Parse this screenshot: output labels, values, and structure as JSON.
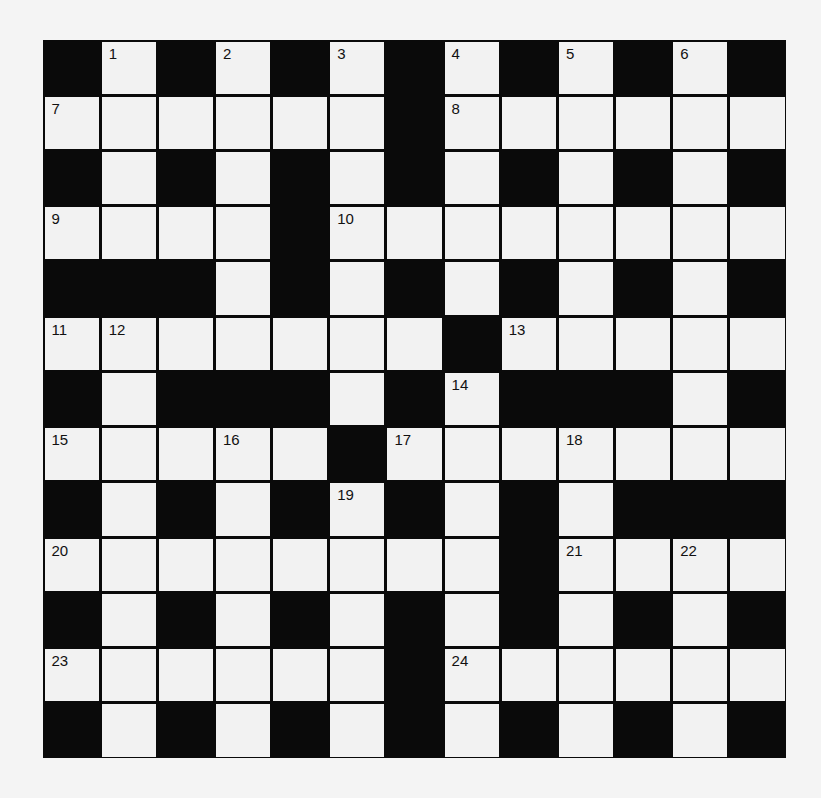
{
  "puzzle": {
    "type": "crossword",
    "rows": 13,
    "cols": 13,
    "grid": [
      "#.#.#.#.#.#.#",
      "......#......",
      "#.#.#.#.#.#.#",
      "....#........",
      "###.#.#.#.#.#",
      ".......#.....",
      "#.###.#.###.#",
      ".....#.......",
      "#.#.#.#.#.###",
      "........#....",
      "#.#.#.#.#.#.#",
      "......#......",
      "#.#.#.#.#.#.#"
    ],
    "numbers": [
      {
        "n": "1",
        "r": 0,
        "c": 1
      },
      {
        "n": "2",
        "r": 0,
        "c": 3
      },
      {
        "n": "3",
        "r": 0,
        "c": 5
      },
      {
        "n": "4",
        "r": 0,
        "c": 7
      },
      {
        "n": "5",
        "r": 0,
        "c": 9
      },
      {
        "n": "6",
        "r": 0,
        "c": 11
      },
      {
        "n": "7",
        "r": 1,
        "c": 0
      },
      {
        "n": "8",
        "r": 1,
        "c": 7
      },
      {
        "n": "9",
        "r": 3,
        "c": 0
      },
      {
        "n": "10",
        "r": 3,
        "c": 5
      },
      {
        "n": "11",
        "r": 5,
        "c": 0
      },
      {
        "n": "12",
        "r": 5,
        "c": 1
      },
      {
        "n": "13",
        "r": 5,
        "c": 8
      },
      {
        "n": "14",
        "r": 6,
        "c": 7
      },
      {
        "n": "15",
        "r": 7,
        "c": 0
      },
      {
        "n": "16",
        "r": 7,
        "c": 3
      },
      {
        "n": "17",
        "r": 7,
        "c": 6
      },
      {
        "n": "18",
        "r": 7,
        "c": 9
      },
      {
        "n": "19",
        "r": 8,
        "c": 5
      },
      {
        "n": "20",
        "r": 9,
        "c": 0
      },
      {
        "n": "21",
        "r": 9,
        "c": 9
      },
      {
        "n": "22",
        "r": 9,
        "c": 11
      },
      {
        "n": "23",
        "r": 11,
        "c": 0
      },
      {
        "n": "24",
        "r": 11,
        "c": 7
      }
    ],
    "colors": {
      "block": "#0a0a0a",
      "cell": "#f2f2f2",
      "background": "#f4f4f4"
    }
  }
}
